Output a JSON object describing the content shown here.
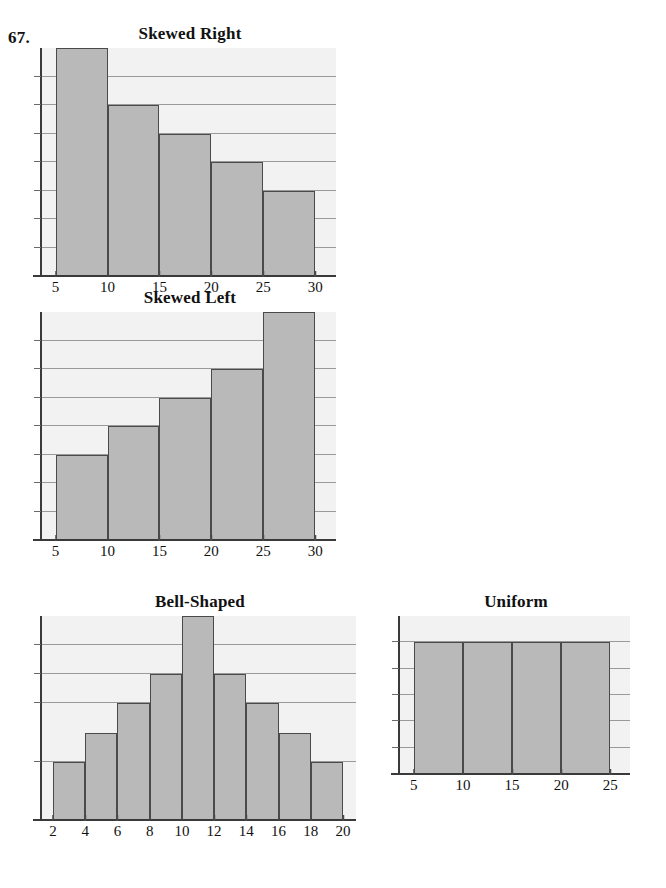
{
  "problem_number": "67.",
  "charts": [
    {
      "key": "skewed-right",
      "title": "Skewed Right",
      "xticks": [
        "5",
        "10",
        "15",
        "20",
        "25",
        "30"
      ]
    },
    {
      "key": "skewed-left",
      "title": "Skewed Left",
      "xticks": [
        "5",
        "10",
        "15",
        "20",
        "25",
        "30"
      ]
    },
    {
      "key": "bell-shaped",
      "title": "Bell-Shaped",
      "xticks": [
        "2",
        "4",
        "6",
        "8",
        "10",
        "12",
        "14",
        "16",
        "18",
        "20"
      ]
    },
    {
      "key": "uniform",
      "title": "Uniform",
      "xticks": [
        "5",
        "10",
        "15",
        "20",
        "25"
      ]
    }
  ],
  "colors": {
    "bar_fill": "#b9b9b9",
    "bar_outline": "#4a4a4a",
    "plot_background": "#f2f2f2",
    "gridline": "#9a9a9a",
    "axis": "#3a3a3a",
    "text": "#111111"
  },
  "chart_data": [
    {
      "type": "bar",
      "title": "Skewed Right",
      "xlabel": "",
      "ylabel": "",
      "grid": true,
      "legend": "none",
      "bin_edges": [
        5,
        10,
        15,
        20,
        25,
        30
      ],
      "categories": [
        "5-10",
        "10-15",
        "15-20",
        "20-25",
        "25-30"
      ],
      "values": [
        8,
        6,
        5,
        4,
        3
      ],
      "xlim": [
        3.5,
        32
      ],
      "ylim": [
        0,
        8
      ],
      "ygridlines": [
        1,
        2,
        3,
        4,
        5,
        6,
        7
      ],
      "xtick_labels": [
        "5",
        "10",
        "15",
        "20",
        "25",
        "30"
      ]
    },
    {
      "type": "bar",
      "title": "Skewed Left",
      "xlabel": "",
      "ylabel": "",
      "grid": true,
      "legend": "none",
      "bin_edges": [
        5,
        10,
        15,
        20,
        25,
        30
      ],
      "categories": [
        "5-10",
        "10-15",
        "15-20",
        "20-25",
        "25-30"
      ],
      "values": [
        3,
        4,
        5,
        6,
        8
      ],
      "xlim": [
        3.5,
        32
      ],
      "ylim": [
        0,
        8
      ],
      "ygridlines": [
        1,
        2,
        3,
        4,
        5,
        6,
        7
      ],
      "xtick_labels": [
        "5",
        "10",
        "15",
        "20",
        "25",
        "30"
      ]
    },
    {
      "type": "bar",
      "title": "Bell-Shaped",
      "xlabel": "",
      "ylabel": "",
      "grid": true,
      "legend": "none",
      "bin_edges": [
        2,
        4,
        6,
        8,
        10,
        12,
        14,
        16,
        18,
        20
      ],
      "categories": [
        "2-4",
        "4-6",
        "6-8",
        "8-10",
        "10-12",
        "12-14",
        "14-16",
        "16-18",
        "18-20"
      ],
      "values": [
        2,
        3,
        4,
        5,
        7,
        5,
        4,
        3,
        2
      ],
      "xlim": [
        1.2,
        20.8
      ],
      "ylim": [
        0,
        7
      ],
      "ygridlines": [
        2,
        4,
        5,
        6
      ],
      "xtick_labels": [
        "2",
        "4",
        "6",
        "8",
        "10",
        "12",
        "14",
        "16",
        "18",
        "20"
      ]
    },
    {
      "type": "bar",
      "title": "Uniform",
      "xlabel": "",
      "ylabel": "",
      "grid": true,
      "legend": "none",
      "bin_edges": [
        5,
        10,
        15,
        20,
        25
      ],
      "categories": [
        "5-10",
        "10-15",
        "15-20",
        "20-25"
      ],
      "values": [
        5,
        5,
        5,
        5
      ],
      "xlim": [
        3.4,
        27
      ],
      "ylim": [
        0,
        6
      ],
      "ygridlines": [
        1,
        2,
        3,
        4,
        5
      ],
      "xtick_labels": [
        "5",
        "10",
        "15",
        "20",
        "25"
      ]
    }
  ]
}
